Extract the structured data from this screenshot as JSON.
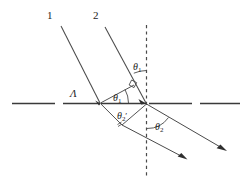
{
  "figure": {
    "background_color": "#ffffff",
    "stroke_color": "#3a3a3a",
    "text_color": "#1d1d1d",
    "width": 247,
    "height": 190
  },
  "labels": {
    "ray_one": "1",
    "ray_two": "2",
    "grating_period": "Λ",
    "theta_1_upper": {
      "symbol": "θ",
      "sub": "1",
      "prime": ""
    },
    "theta_1_inner": {
      "symbol": "θ",
      "sub": "1",
      "prime": ""
    },
    "theta_2_prime": {
      "symbol": "θ",
      "sub": "2",
      "prime": "′"
    },
    "theta_2_outer": {
      "symbol": "θ",
      "sub": "2",
      "prime": ""
    }
  },
  "elements": {
    "horizontal_interface": "dashed-horizontal-interface-line",
    "vertical_normal": "dashed-vertical-normal-line",
    "incident_ray_1": "incident-ray-1",
    "incident_ray_2": "incident-ray-2",
    "refracted_ray_1": "refracted-ray-1",
    "refracted_ray_2": "refracted-ray-2",
    "wavefront_segment": "wavefront-perpendicular-segment",
    "right_angle_marker": "right-angle-marker",
    "path_difference_segment": "path-difference-segment",
    "arc_theta_1_upper": "arc-theta-1-upper",
    "arc_theta_1_inner": "arc-theta-1-inner",
    "arc_theta_2_outer": "arc-theta-2-outer",
    "vertex_left": "interface-vertex-left",
    "vertex_right": "interface-vertex-right"
  }
}
